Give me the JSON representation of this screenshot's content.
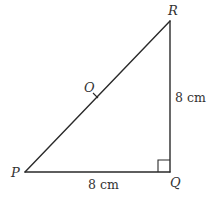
{
  "diagram": {
    "type": "right-triangle",
    "vertices": {
      "P": {
        "label": "P",
        "x": 25,
        "y": 172
      },
      "Q": {
        "label": "Q",
        "x": 170,
        "y": 172
      },
      "R": {
        "label": "R",
        "x": 170,
        "y": 21
      }
    },
    "point_on_hypotenuse": {
      "label": "O",
      "x": 96,
      "y": 96
    },
    "right_angle_at": "Q",
    "measurements": {
      "PQ": "8 cm",
      "QR": "8 cm"
    },
    "colors": {
      "line": "#2a2a2a",
      "text": "#333333",
      "background": "#ffffff"
    }
  }
}
